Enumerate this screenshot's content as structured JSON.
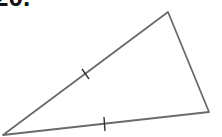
{
  "problem": {
    "number_label": "20."
  },
  "diagram": {
    "type": "triangle",
    "vertices": {
      "left": [
        3,
        135
      ],
      "top": [
        168,
        12
      ],
      "right": [
        209,
        112
      ]
    },
    "tick_marks": [
      {
        "edge": "left-top",
        "count": 1
      },
      {
        "edge": "left-right",
        "count": 1
      }
    ],
    "stroke_color": "#6b6b6b",
    "tick_color": "#333333"
  }
}
